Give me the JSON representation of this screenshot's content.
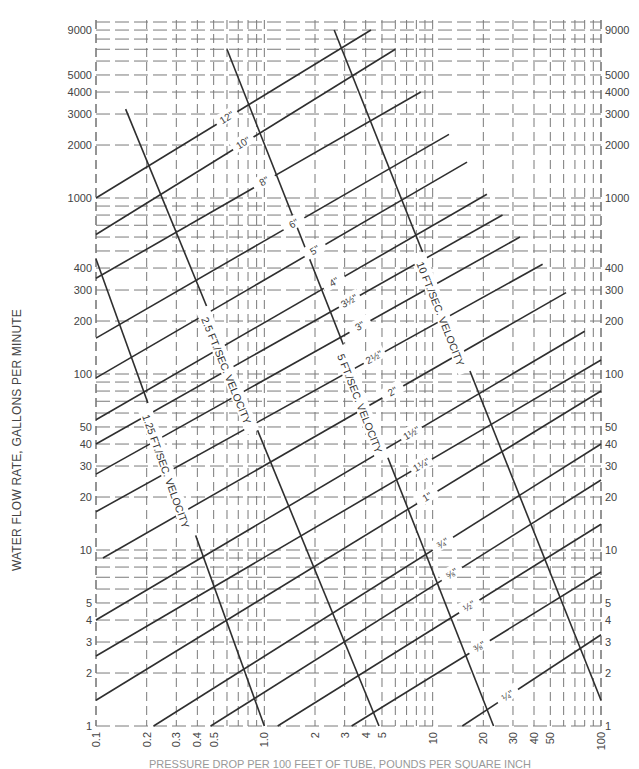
{
  "chart_data": {
    "type": "line",
    "title": "",
    "xlabel": "PRESSURE DROP PER 100 FEET OF TUBE, POUNDS PER SQUARE INCH",
    "ylabel": "WATER FLOW RATE, GALLONS PER MINUTE",
    "xscale": "log",
    "yscale": "log",
    "xlim": [
      0.1,
      100
    ],
    "ylim": [
      1,
      10000
    ],
    "grid": true,
    "grid_style": "dashed",
    "x_ticks": [
      "0.1",
      "0.2",
      "0.3",
      "0.4",
      "0.5",
      "1.0",
      "2",
      "3",
      "4",
      "5",
      "10",
      "20",
      "30",
      "40",
      "50",
      "100"
    ],
    "x_tick_values": [
      0.1,
      0.2,
      0.3,
      0.4,
      0.5,
      1.0,
      2,
      3,
      4,
      5,
      10,
      20,
      30,
      40,
      50,
      100
    ],
    "y_ticks_left": [
      "1",
      "2",
      "3",
      "4",
      "5",
      "10",
      "20",
      "30",
      "40",
      "50",
      "100",
      "200",
      "300",
      "400",
      "1000",
      "2000",
      "3000",
      "4000",
      "5000",
      "9000"
    ],
    "y_ticks_right": [
      "1",
      "2",
      "3",
      "4",
      "5",
      "10",
      "20",
      "30",
      "40",
      "50",
      "100",
      "200",
      "300",
      "400",
      "1000",
      "2000",
      "3000",
      "4000",
      "5000",
      "9000"
    ],
    "y_tick_values": [
      1,
      2,
      3,
      4,
      5,
      10,
      20,
      30,
      40,
      50,
      100,
      200,
      300,
      400,
      1000,
      2000,
      3000,
      4000,
      5000,
      9000
    ],
    "pipe_series": [
      {
        "name": "12\"",
        "label": "12\"",
        "points": [
          [
            0.1,
            1000
          ],
          [
            4.3,
            9000
          ]
        ]
      },
      {
        "name": "10\"",
        "label": "10\"",
        "points": [
          [
            0.1,
            620
          ],
          [
            6.0,
            7000
          ]
        ]
      },
      {
        "name": "8\"",
        "label": "8\"",
        "points": [
          [
            0.1,
            350
          ],
          [
            8.5,
            4000
          ]
        ]
      },
      {
        "name": "6\"",
        "label": "6\"",
        "points": [
          [
            0.1,
            160
          ],
          [
            12.5,
            2300
          ]
        ]
      },
      {
        "name": "5\"",
        "label": "5\"",
        "points": [
          [
            0.1,
            95
          ],
          [
            16,
            1600
          ]
        ]
      },
      {
        "name": "4\"",
        "label": "4\"",
        "points": [
          [
            0.1,
            55
          ],
          [
            21,
            1050
          ]
        ]
      },
      {
        "name": "3-1/2\"",
        "label": "3½\"",
        "points": [
          [
            0.1,
            40
          ],
          [
            26,
            800
          ]
        ]
      },
      {
        "name": "3\"",
        "label": "3\"",
        "points": [
          [
            0.1,
            27
          ],
          [
            33,
            600
          ]
        ]
      },
      {
        "name": "2-1/2\"",
        "label": "2½\"",
        "points": [
          [
            0.1,
            16.5
          ],
          [
            45,
            420
          ]
        ]
      },
      {
        "name": "2\"",
        "label": "2\"",
        "points": [
          [
            0.11,
            9
          ],
          [
            62,
            290
          ]
        ]
      },
      {
        "name": "1-1/2\"",
        "label": "1½\"",
        "points": [
          [
            0.1,
            4
          ],
          [
            80,
            175
          ]
        ]
      },
      {
        "name": "1-1/4\"",
        "label": "1¼\"",
        "points": [
          [
            0.1,
            2.5
          ],
          [
            100,
            120
          ]
        ]
      },
      {
        "name": "1\"",
        "label": "1\"",
        "points": [
          [
            0.1,
            1.4
          ],
          [
            100,
            80
          ]
        ]
      },
      {
        "name": "3/4\"",
        "label": "¾\"",
        "points": [
          [
            0.22,
            1
          ],
          [
            100,
            40
          ]
        ]
      },
      {
        "name": "5/8\"",
        "label": "⅝\"",
        "points": [
          [
            0.48,
            1
          ],
          [
            100,
            25
          ]
        ]
      },
      {
        "name": "1/2\"",
        "label": "½\"",
        "points": [
          [
            1.2,
            1
          ],
          [
            100,
            14
          ]
        ]
      },
      {
        "name": "3/8\"",
        "label": "⅜\"",
        "points": [
          [
            3.3,
            1
          ],
          [
            100,
            7.5
          ]
        ]
      },
      {
        "name": "1/4\"",
        "label": "¼\"",
        "points": [
          [
            15,
            1
          ],
          [
            100,
            3.3
          ]
        ]
      }
    ],
    "velocity_series": [
      {
        "name": "1.25 FT./SEC. VELOCITY",
        "label": "1.25 FT./SEC. VELOCITY",
        "points": [
          [
            0.1,
            450
          ],
          [
            1.0,
            1
          ]
        ]
      },
      {
        "name": "2.5 FT./SEC. VELOCITY",
        "label": "2.5 FT./SEC. VELOCITY",
        "points": [
          [
            0.15,
            3200
          ],
          [
            4.8,
            1
          ]
        ]
      },
      {
        "name": "5 FT./SEC. VELOCITY",
        "label": "5 FT./SEC. VELOCITY",
        "points": [
          [
            0.6,
            7000
          ],
          [
            23,
            1
          ]
        ]
      },
      {
        "name": "10 FT./SEC. VELOCITY",
        "label": "10 FT./SEC. VELOCITY",
        "points": [
          [
            2.6,
            9000
          ],
          [
            100,
            1.4
          ]
        ]
      }
    ],
    "series_color": "#2f2f2f",
    "grid_color": "#7a7a7a"
  }
}
